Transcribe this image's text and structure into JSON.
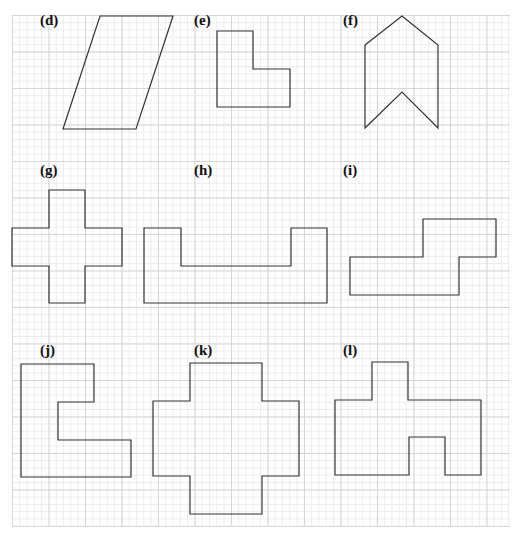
{
  "figure": {
    "grid": {
      "cell_px": 7.3,
      "major_every": 5
    },
    "stroke_color": "#333333",
    "panels": [
      {
        "label": "(d)",
        "label_pos": [
          40,
          12
        ],
        "shape": "parallelogram",
        "points": [
          [
            100,
            16
          ],
          [
            173,
            16
          ],
          [
            136,
            129
          ],
          [
            63,
            129
          ]
        ]
      },
      {
        "label": "(e)",
        "label_pos": [
          194,
          12
        ],
        "shape": "L-shape",
        "points": [
          [
            217,
            31
          ],
          [
            253,
            31
          ],
          [
            253,
            69
          ],
          [
            290,
            69
          ],
          [
            290,
            107
          ],
          [
            217,
            107
          ]
        ]
      },
      {
        "label": "(f)",
        "label_pos": [
          343,
          12
        ],
        "shape": "chevron",
        "points": [
          [
            365,
            45
          ],
          [
            402,
            16
          ],
          [
            438,
            45
          ],
          [
            438,
            128
          ],
          [
            402,
            92
          ],
          [
            365,
            128
          ]
        ]
      },
      {
        "label": "(g)",
        "label_pos": [
          40,
          162
        ],
        "shape": "cross",
        "points": [
          [
            49,
            190
          ],
          [
            85,
            190
          ],
          [
            85,
            228
          ],
          [
            122,
            228
          ],
          [
            122,
            266
          ],
          [
            85,
            266
          ],
          [
            85,
            303
          ],
          [
            49,
            303
          ],
          [
            49,
            266
          ],
          [
            12,
            266
          ],
          [
            12,
            228
          ],
          [
            49,
            228
          ]
        ]
      },
      {
        "label": "(h)",
        "label_pos": [
          194,
          162
        ],
        "shape": "U-shape",
        "points": [
          [
            144,
            228
          ],
          [
            181,
            228
          ],
          [
            181,
            266
          ],
          [
            291,
            266
          ],
          [
            291,
            228
          ],
          [
            327,
            228
          ],
          [
            327,
            303
          ],
          [
            144,
            303
          ]
        ]
      },
      {
        "label": "(i)",
        "label_pos": [
          343,
          162
        ],
        "shape": "step-shape",
        "points": [
          [
            350,
            257
          ],
          [
            423,
            257
          ],
          [
            423,
            219
          ],
          [
            496,
            219
          ],
          [
            496,
            257
          ],
          [
            459,
            257
          ],
          [
            459,
            295
          ],
          [
            350,
            295
          ]
        ]
      },
      {
        "label": "(j)",
        "label_pos": [
          40,
          342
        ],
        "shape": "C-shape",
        "points": [
          [
            21,
            364
          ],
          [
            94,
            364
          ],
          [
            94,
            402
          ],
          [
            58,
            402
          ],
          [
            58,
            440
          ],
          [
            131,
            440
          ],
          [
            131,
            477
          ],
          [
            21,
            477
          ]
        ]
      },
      {
        "label": "(k)",
        "label_pos": [
          194,
          342
        ],
        "shape": "big-cross",
        "points": [
          [
            190,
            363
          ],
          [
            262,
            363
          ],
          [
            262,
            401
          ],
          [
            299,
            401
          ],
          [
            299,
            476
          ],
          [
            262,
            476
          ],
          [
            262,
            514
          ],
          [
            190,
            514
          ],
          [
            190,
            476
          ],
          [
            153,
            476
          ],
          [
            153,
            401
          ],
          [
            190,
            401
          ]
        ]
      },
      {
        "label": "(l)",
        "label_pos": [
          343,
          342
        ],
        "shape": "compound-shape",
        "points": [
          [
            335,
            400
          ],
          [
            372,
            400
          ],
          [
            372,
            362
          ],
          [
            408,
            362
          ],
          [
            408,
            400
          ],
          [
            481,
            400
          ],
          [
            481,
            475
          ],
          [
            445,
            475
          ],
          [
            445,
            437
          ],
          [
            409,
            437
          ],
          [
            409,
            475
          ],
          [
            335,
            475
          ]
        ]
      }
    ]
  }
}
